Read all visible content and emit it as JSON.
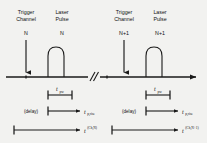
{
  "figure": {
    "type": "timing-diagram",
    "background_color": "#f2f2f0",
    "line_color": "#1a1a1a",
    "axis": {
      "label": "time",
      "has_arrowhead": true,
      "has_break": true,
      "break_symbol": "//"
    }
  },
  "groups": [
    {
      "index_label": "N",
      "trigger": {
        "header_line1": "Trigger",
        "header_line2": "Channel",
        "index": "N",
        "arrow_direction": "down"
      },
      "laser": {
        "header_line1": "Laser",
        "header_line2": "Pulse",
        "index": "N"
      },
      "pulse_width": {
        "symbol": "t",
        "subscript": "pw",
        "superscript": ""
      },
      "delay_row": {
        "note": "(delay)",
        "symbol": "t",
        "subscript": "p,rise",
        "superscript": ""
      },
      "total_row": {
        "symbol": "t",
        "subscript": "",
        "superscript": "(Ch,N)"
      }
    },
    {
      "index_label": "N+1",
      "trigger": {
        "header_line1": "Trigger",
        "header_line2": "Channel",
        "index": "N+1",
        "arrow_direction": "down"
      },
      "laser": {
        "header_line1": "Laser",
        "header_line2": "Pulse",
        "index": "N+1"
      },
      "pulse_width": {
        "symbol": "t",
        "subscript": "pw",
        "superscript": ""
      },
      "delay_row": {
        "note": "(delay)",
        "symbol": "t",
        "subscript": "p,rise",
        "superscript": ""
      },
      "total_row": {
        "symbol": "t",
        "subscript": "",
        "superscript": "(Ch,N+1)"
      }
    }
  ]
}
